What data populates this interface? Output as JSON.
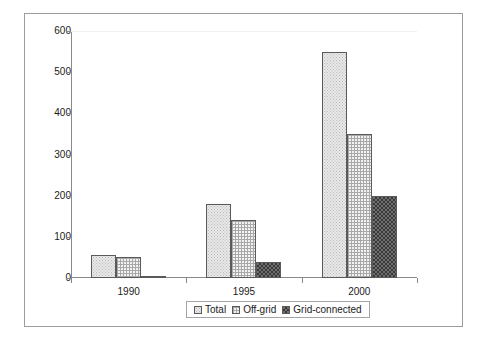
{
  "chart_data": {
    "type": "bar",
    "title": "",
    "subtitle": "",
    "xlabel": "",
    "ylabel": "Megawatts",
    "categories": [
      "1990",
      "1995",
      "2000"
    ],
    "series": [
      {
        "name": "Total",
        "values": [
          55,
          180,
          550
        ],
        "pattern": "light-stipple",
        "color": "#e8e8e8"
      },
      {
        "name": "Off-grid",
        "values": [
          52,
          142,
          350
        ],
        "pattern": "cross-hatch",
        "color": "#f2f2f2"
      },
      {
        "name": "Grid-connected",
        "values": [
          2,
          38,
          200
        ],
        "pattern": "dark-checker",
        "color": "#6e6e6e"
      }
    ],
    "ylim": [
      0,
      600
    ],
    "ytick_step": 100,
    "yticks": [
      "0",
      "100",
      "200",
      "300",
      "400",
      "500",
      "600"
    ],
    "grid": false,
    "legend_position": "bottom-center",
    "legend_entries": [
      "Total",
      "Off-grid",
      "Grid-connected"
    ]
  },
  "axes": {
    "y_title": "Megawatts"
  },
  "legend": {
    "items": [
      {
        "label": "Total"
      },
      {
        "label": "Off-grid"
      },
      {
        "label": "Grid-connected"
      }
    ]
  }
}
